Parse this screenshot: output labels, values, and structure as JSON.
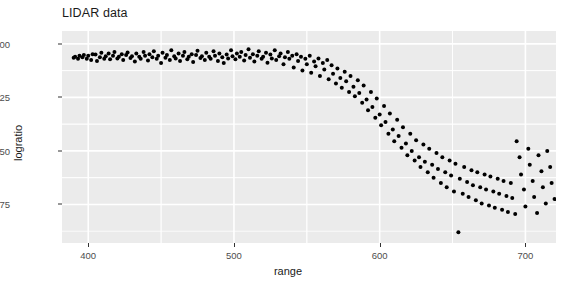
{
  "chart_data": {
    "type": "scatter",
    "title": "LIDAR data",
    "xlabel": "range",
    "ylabel": "logratio",
    "xlim": [
      382,
      721
    ],
    "ylim": [
      -0.93,
      0.06
    ],
    "xticks": [
      400,
      500,
      600,
      700
    ],
    "xtick_labels": [
      "400",
      "500",
      "600",
      "700"
    ],
    "yticks": [
      0.0,
      -0.25,
      -0.5,
      -0.75
    ],
    "ytick_labels": [
      "0.00",
      "-0.25",
      "-0.50",
      "-0.75"
    ],
    "grid": true,
    "grid_color": "#ffffff",
    "panel_background": "#ebebeb",
    "point_color": "#000000",
    "point_size": 4,
    "legend": "none",
    "n_points": 221,
    "x": [
      390.0,
      391.0,
      393.0,
      394.0,
      396.0,
      397.0,
      399.0,
      400.0,
      402.0,
      403.0,
      405.0,
      406.0,
      408.0,
      409.0,
      411.0,
      412.0,
      414.0,
      415.0,
      417.0,
      418.0,
      420.0,
      421.0,
      423.0,
      424.0,
      426.0,
      427.0,
      429.0,
      430.0,
      432.0,
      433.0,
      435.0,
      436.0,
      438.0,
      439.0,
      441.0,
      442.0,
      444.0,
      445.0,
      447.0,
      448.0,
      450.0,
      451.0,
      453.0,
      454.0,
      456.0,
      457.0,
      459.0,
      460.0,
      462.0,
      463.0,
      465.0,
      466.0,
      468.0,
      469.0,
      471.0,
      472.0,
      474.0,
      475.0,
      477.0,
      478.0,
      480.0,
      481.0,
      483.0,
      484.0,
      486.0,
      487.0,
      489.0,
      490.0,
      492.0,
      493.0,
      495.0,
      496.0,
      498.0,
      499.0,
      501.0,
      502.0,
      504.0,
      505.0,
      507.0,
      508.0,
      510.0,
      511.0,
      513.0,
      514.0,
      516.0,
      517.0,
      519.0,
      520.0,
      522.0,
      523.0,
      525.0,
      526.0,
      528.0,
      529.0,
      531.0,
      532.0,
      534.0,
      535.0,
      537.0,
      538.0,
      540.0,
      541.0,
      543.0,
      544.0,
      546.0,
      547.0,
      549.0,
      550.0,
      552.0,
      553.0,
      555.0,
      556.0,
      558.0,
      559.0,
      561.0,
      562.0,
      564.0,
      565.0,
      567.0,
      568.0,
      570.0,
      571.0,
      573.0,
      574.0,
      576.0,
      577.0,
      579.0,
      580.0,
      582.0,
      583.0,
      585.0,
      586.0,
      588.0,
      589.0,
      591.0,
      592.0,
      594.0,
      595.0,
      597.0,
      598.0,
      600.0,
      601.0,
      603.0,
      604.0,
      606.0,
      607.0,
      609.0,
      610.0,
      612.0,
      613.0,
      615.0,
      616.0,
      618.0,
      619.0,
      621.0,
      622.0,
      624.0,
      625.0,
      627.0,
      628.0,
      630.0,
      631.0,
      633.0,
      634.0,
      636.0,
      637.0,
      639.0,
      640.0,
      642.0,
      643.0,
      645.0,
      646.0,
      648.0,
      649.0,
      651.0,
      652.0,
      654.0,
      655.0,
      657.0,
      658.0,
      660.0,
      661.0,
      663.0,
      664.0,
      666.0,
      667.0,
      669.0,
      670.0,
      672.0,
      673.0,
      675.0,
      676.0,
      678.0,
      679.0,
      681.0,
      682.0,
      684.0,
      685.0,
      687.0,
      688.0,
      690.0,
      691.0,
      693.0,
      694.0,
      696.0,
      697.0,
      699.0,
      700.0,
      702.0,
      703.0,
      705.0,
      706.0,
      708.0,
      709.0,
      711.0,
      712.0,
      714.0,
      715.0,
      717.0,
      718.0,
      720.0
    ],
    "y": [
      -0.065,
      -0.06,
      -0.07,
      -0.055,
      -0.062,
      -0.052,
      -0.07,
      -0.055,
      -0.075,
      -0.048,
      -0.05,
      -0.08,
      -0.062,
      -0.042,
      -0.07,
      -0.058,
      -0.045,
      -0.072,
      -0.055,
      -0.038,
      -0.068,
      -0.06,
      -0.048,
      -0.075,
      -0.052,
      -0.04,
      -0.066,
      -0.058,
      -0.082,
      -0.045,
      -0.06,
      -0.07,
      -0.038,
      -0.055,
      -0.078,
      -0.048,
      -0.062,
      -0.035,
      -0.07,
      -0.055,
      -0.09,
      -0.042,
      -0.065,
      -0.052,
      -0.075,
      -0.03,
      -0.058,
      -0.068,
      -0.045,
      -0.08,
      -0.055,
      -0.038,
      -0.072,
      -0.06,
      -0.048,
      -0.085,
      -0.052,
      -0.032,
      -0.066,
      -0.058,
      -0.075,
      -0.042,
      -0.06,
      -0.07,
      -0.035,
      -0.055,
      -0.08,
      -0.045,
      -0.062,
      -0.09,
      -0.05,
      -0.068,
      -0.03,
      -0.058,
      -0.072,
      -0.045,
      -0.06,
      -0.038,
      -0.078,
      -0.052,
      -0.025,
      -0.065,
      -0.048,
      -0.082,
      -0.055,
      -0.035,
      -0.07,
      -0.06,
      -0.042,
      -0.088,
      -0.05,
      -0.068,
      -0.03,
      -0.075,
      -0.058,
      -0.045,
      -0.095,
      -0.062,
      -0.038,
      -0.07,
      -0.055,
      -0.11,
      -0.048,
      -0.08,
      -0.06,
      -0.125,
      -0.07,
      -0.095,
      -0.055,
      -0.135,
      -0.082,
      -0.105,
      -0.068,
      -0.15,
      -0.09,
      -0.12,
      -0.075,
      -0.165,
      -0.1,
      -0.14,
      -0.185,
      -0.115,
      -0.16,
      -0.205,
      -0.13,
      -0.175,
      -0.225,
      -0.15,
      -0.2,
      -0.245,
      -0.17,
      -0.23,
      -0.275,
      -0.195,
      -0.26,
      -0.31,
      -0.225,
      -0.295,
      -0.345,
      -0.255,
      -0.33,
      -0.38,
      -0.29,
      -0.365,
      -0.42,
      -0.325,
      -0.4,
      -0.455,
      -0.355,
      -0.43,
      -0.485,
      -0.39,
      -0.465,
      -0.52,
      -0.42,
      -0.5,
      -0.545,
      -0.45,
      -0.53,
      -0.575,
      -0.47,
      -0.55,
      -0.6,
      -0.49,
      -0.565,
      -0.625,
      -0.51,
      -0.585,
      -0.65,
      -0.53,
      -0.6,
      -0.67,
      -0.545,
      -0.615,
      -0.69,
      -0.56,
      -0.88,
      -0.63,
      -0.7,
      -0.575,
      -0.645,
      -0.715,
      -0.59,
      -0.66,
      -0.73,
      -0.6,
      -0.67,
      -0.745,
      -0.61,
      -0.68,
      -0.755,
      -0.62,
      -0.69,
      -0.765,
      -0.63,
      -0.7,
      -0.775,
      -0.64,
      -0.71,
      -0.785,
      -0.65,
      -0.72,
      -0.795,
      -0.455,
      -0.53,
      -0.61,
      -0.68,
      -0.76,
      -0.49,
      -0.565,
      -0.64,
      -0.715,
      -0.79,
      -0.52,
      -0.595,
      -0.67,
      -0.745,
      -0.5,
      -0.575,
      -0.65,
      -0.725
    ]
  }
}
